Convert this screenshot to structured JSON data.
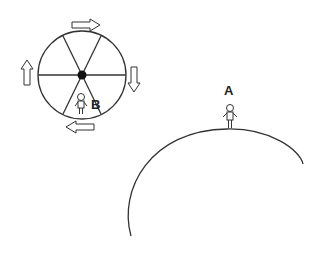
{
  "diagram": {
    "labels": {
      "a": "A",
      "b": "B"
    },
    "wheel": {
      "spokes": 6,
      "rotation": "clockwise",
      "arrows": [
        "right",
        "down",
        "left",
        "up"
      ]
    },
    "colors": {
      "stroke": "#333333",
      "hub": "#111111",
      "background": "#ffffff"
    }
  }
}
